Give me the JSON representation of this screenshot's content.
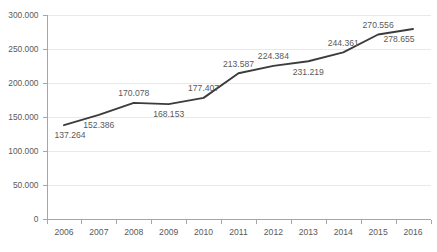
{
  "chart_data": {
    "type": "line",
    "title": "",
    "subtitle": "",
    "xlabel": "",
    "ylabel": "",
    "categories": [
      "2006",
      "2007",
      "2008",
      "2009",
      "2010",
      "2011",
      "2012",
      "2013",
      "2014",
      "2015",
      "2016"
    ],
    "series": [
      {
        "name": "",
        "values": [
          137264,
          152386,
          170078,
          168153,
          177407,
          213587,
          224384,
          231219,
          244361,
          270556,
          278655
        ]
      }
    ],
    "point_labels": [
      "137.264",
      "152.386",
      "170.078",
      "168.153",
      "177.407",
      "213.587",
      "224.384",
      "231.219",
      "244.361",
      "270.556",
      "278.655"
    ],
    "point_label_positions": [
      "below",
      "below",
      "above",
      "below",
      "above",
      "above",
      "above",
      "below",
      "above",
      "above",
      "below"
    ],
    "ylim": [
      0,
      300000
    ],
    "ytick_values": [
      0,
      50000,
      100000,
      150000,
      200000,
      250000,
      300000
    ],
    "ytick_labels": [
      "0",
      "50.000",
      "100.000",
      "150.000",
      "200.000",
      "250.000",
      "300.000"
    ],
    "grid": true,
    "grid_axis": "y",
    "legend": false,
    "legend_position": "none",
    "markers": false,
    "number_format": "european-thousands-dot",
    "colors": {
      "line": "#3c3c3c",
      "gridline": "#e9e9e9",
      "axis": "#a6a6a6",
      "text": "#5a5a5a",
      "background": "#ffffff"
    }
  }
}
